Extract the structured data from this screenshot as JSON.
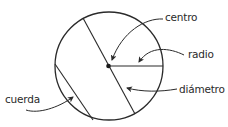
{
  "diagram": {
    "labels": {
      "centro": "centro",
      "radio": "radio",
      "diametro": "diámetro",
      "cuerda": "cuerda"
    },
    "colors": {
      "stroke": "#2a2a2a",
      "text": "#2a2a2a",
      "background": "#ffffff"
    },
    "geometry": {
      "circle": {
        "cx": 109,
        "cy": 66,
        "r": 54
      },
      "center_dot": {
        "cx": 108.5,
        "cy": 66,
        "r": 2.3
      },
      "radius_line": {
        "x1": 109,
        "y1": 66,
        "x2": 163,
        "y2": 66
      },
      "diameter_line": {
        "x1": 83,
        "y1": 18,
        "x2": 135,
        "y2": 114
      },
      "chord_line": {
        "x1": 55,
        "y1": 64,
        "x2": 93,
        "y2": 120
      }
    }
  }
}
